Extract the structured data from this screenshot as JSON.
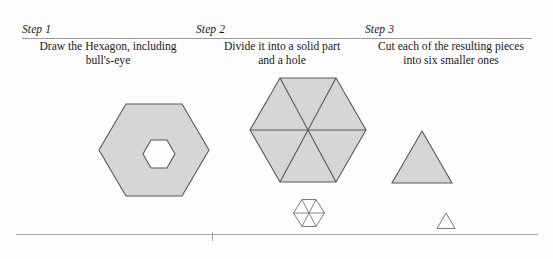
{
  "figure": {
    "columns": [
      {
        "label": "Step 1",
        "description_line1": "Draw the Hexagon, including",
        "description_line2": "bull's-eye"
      },
      {
        "label": "Step 2",
        "description_line1": "Divide it into a solid part",
        "description_line2": "and a hole"
      },
      {
        "label": "Step 3",
        "description_line1": "Cut each of the resulting pieces",
        "description_line2": "into six smaller ones"
      }
    ],
    "shapes": {
      "step1_hexagon": "large-gray-hexagon-with-hexagonal-hole",
      "step2_hexagon": "large-gray-hexagon-divided-into-six-triangles",
      "step2_small_hexagon": "small-white-hexagon-divided-into-six-triangles",
      "step3_triangle": "gray-triangle",
      "step3_small_triangle": "small-white-triangle"
    },
    "colors": {
      "shape_fill": "#d6d6d6",
      "shape_stroke": "#585858",
      "hole_fill": "#fdfdfd",
      "rule": "#9a9a9a",
      "text": "#1a1a1a",
      "background": "#fdfdfd"
    }
  }
}
